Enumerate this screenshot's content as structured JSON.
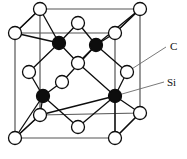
{
  "figure": {
    "name": "sic-zinc-blende-unit-cell",
    "width": 187,
    "height": 159,
    "background_color": "#ffffff",
    "cell_edge_color": "#555555",
    "bond_color": "#0d0d0d",
    "atoms": {
      "carbon": {
        "label": "C",
        "fill_color": "#0d0d0d",
        "stroke_color": "#0d0d0d",
        "radius": 6.5,
        "count": 4,
        "positions": [
          {
            "x": 59,
            "y": 43
          },
          {
            "x": 96,
            "y": 45
          },
          {
            "x": 43,
            "y": 96
          },
          {
            "x": 115,
            "y": 96
          }
        ]
      },
      "silicon": {
        "label": "Si",
        "fill_color": "#ffffff",
        "stroke_color": "#0d0d0d",
        "radius": 6.5,
        "count": 14,
        "positions": [
          {
            "x": 40,
            "y": 9
          },
          {
            "x": 140,
            "y": 9
          },
          {
            "x": 78,
            "y": 23
          },
          {
            "x": 15,
            "y": 33
          },
          {
            "x": 115,
            "y": 33
          },
          {
            "x": 78,
            "y": 63
          },
          {
            "x": 29,
            "y": 72
          },
          {
            "x": 127,
            "y": 72
          },
          {
            "x": 62,
            "y": 82
          },
          {
            "x": 40,
            "y": 115
          },
          {
            "x": 140,
            "y": 113
          },
          {
            "x": 78,
            "y": 127
          },
          {
            "x": 15,
            "y": 138
          },
          {
            "x": 115,
            "y": 138
          }
        ]
      }
    },
    "labels": [
      {
        "id": "label-c",
        "text": "C",
        "x": 170,
        "y": 50,
        "leader_from": {
          "x": 127,
          "y": 72
        },
        "leader_to": {
          "x": 166,
          "y": 47
        }
      },
      {
        "id": "label-si",
        "text": "Si",
        "x": 168,
        "y": 85,
        "leader_from": {
          "x": 115,
          "y": 96
        },
        "leader_to": {
          "x": 164,
          "y": 82
        }
      }
    ],
    "cube": {
      "front_face": [
        {
          "x": 15,
          "y": 33
        },
        {
          "x": 115,
          "y": 33
        },
        {
          "x": 115,
          "y": 138
        },
        {
          "x": 15,
          "y": 138
        }
      ],
      "back_face": [
        {
          "x": 40,
          "y": 9
        },
        {
          "x": 140,
          "y": 9
        },
        {
          "x": 140,
          "y": 113
        },
        {
          "x": 40,
          "y": 115
        }
      ]
    }
  }
}
